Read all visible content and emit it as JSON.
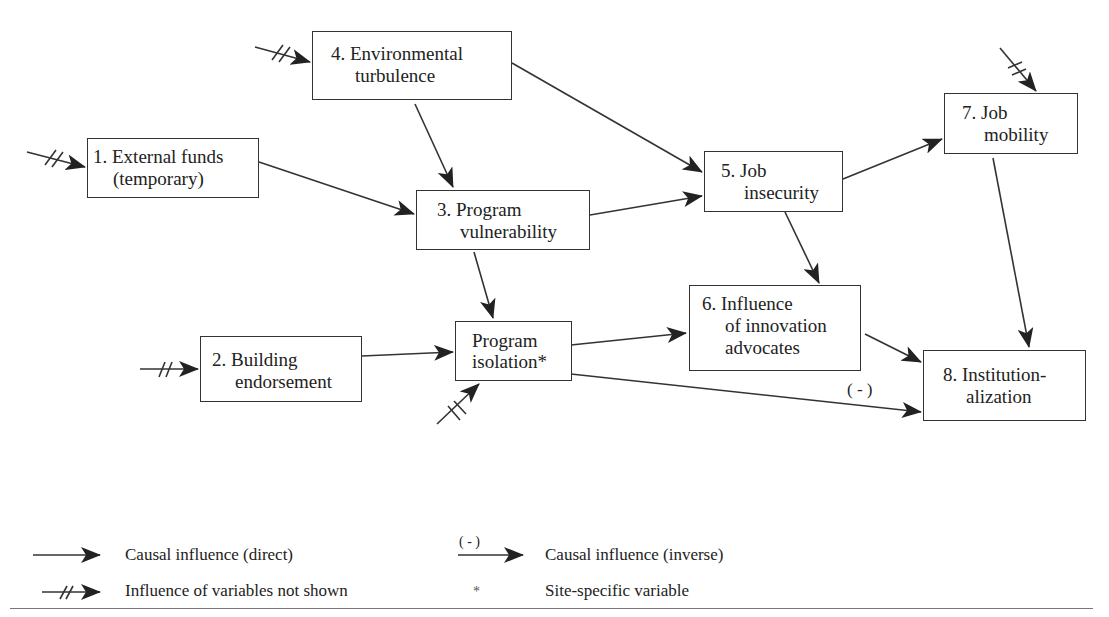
{
  "nodes": {
    "n1": {
      "line1": "1. External funds",
      "line2": "(temporary)"
    },
    "n2": {
      "line1": "2. Building",
      "line2": "endorsement"
    },
    "n3": {
      "line1": "3. Program",
      "line2": "vulnerability"
    },
    "n4": {
      "line1": "4. Environmental",
      "line2": "turbulence"
    },
    "n5": {
      "line1": "5. Job",
      "line2": "insecurity"
    },
    "n6": {
      "line1": "6. Influence",
      "line2": "of innovation",
      "line3": "advocates"
    },
    "n7": {
      "line1": "7. Job",
      "line2": "mobility"
    },
    "n8": {
      "line1": "8. Institution-",
      "line2": "alization"
    },
    "iso": {
      "line1": "Program",
      "line2": "isolation*"
    }
  },
  "edge_labels": {
    "inverse": "( - )"
  },
  "legend": {
    "direct": "Causal influence (direct)",
    "inverse_mark": "( - )",
    "inverse": "Causal influence (inverse)",
    "not_shown": "Influence of variables not shown",
    "asterisk": "*",
    "site_specific": "Site-specific variable"
  }
}
